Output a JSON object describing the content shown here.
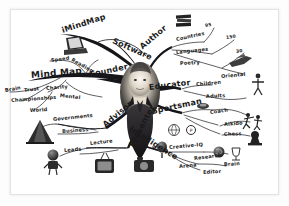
{
  "document": {
    "type": "mind-map",
    "title": "Tony Buzan Mind Map",
    "style": "hand-drawn grayscale organic mind map",
    "background_color": "#ffffff",
    "ink_color": "#1a1a1a",
    "paper_border_color": "#e3e3e3"
  },
  "center": {
    "label": "",
    "description": "photograph of a smiling man in a dark suit with white shirt and tie at the hub of the map",
    "name": "central-portrait"
  },
  "branches": [
    {
      "id": "imindmap",
      "label": "iMindMap",
      "angle": -18,
      "x": 62,
      "y": 32,
      "icon": "laptop-icon",
      "icon_x": 64,
      "icon_y": 38,
      "children": []
    },
    {
      "id": "software",
      "label": "Software",
      "angle": 22,
      "x": 113,
      "y": 39,
      "children": []
    },
    {
      "id": "mindmap",
      "label": "Mind Map",
      "angle": -6,
      "x": 34,
      "y": 76,
      "children": [
        {
          "label": "Speed",
          "x": 53,
          "y": 60,
          "angle": -8
        },
        {
          "label": "Reading",
          "x": 74,
          "y": 60,
          "angle": 28
        },
        {
          "label": "Brain",
          "x": 6,
          "y": 90,
          "angle": -10
        },
        {
          "label": "Trust",
          "x": 24,
          "y": 91,
          "angle": -6
        },
        {
          "label": "Charity",
          "x": 47,
          "y": 89,
          "angle": -4
        },
        {
          "label": "Championships",
          "x": 12,
          "y": 100,
          "angle": -3
        },
        {
          "label": "Mental",
          "x": 61,
          "y": 96,
          "angle": 4
        },
        {
          "label": "World",
          "x": 31,
          "y": 110,
          "angle": -2
        }
      ]
    },
    {
      "id": "founder",
      "label": "Founder",
      "angle": -14,
      "x": 93,
      "y": 75,
      "children": []
    },
    {
      "id": "author",
      "label": "Author",
      "angle": -22,
      "x": 140,
      "y": 47,
      "children": [
        {
          "label": "Countries",
          "x": 177,
          "y": 39,
          "angle": -12,
          "value": "95",
          "value_x": 206,
          "value_y": 26
        },
        {
          "label": "Languages",
          "x": 177,
          "y": 52,
          "angle": -6,
          "value": "150",
          "value_x": 227,
          "value_y": 38
        },
        {
          "label": "Poetry",
          "x": 180,
          "y": 63,
          "angle": -2,
          "value": "30",
          "value_x": 237,
          "value_y": 52
        },
        {
          "label": "Oriental",
          "x": 221,
          "y": 76,
          "angle": -4
        }
      ]
    },
    {
      "id": "educator",
      "label": "Educator",
      "angle": -6,
      "x": 148,
      "y": 86,
      "children": [
        {
          "label": "Children",
          "x": 196,
          "y": 84,
          "angle": -4
        },
        {
          "label": "Adults",
          "x": 205,
          "y": 96,
          "angle": -2
        }
      ]
    },
    {
      "id": "sportsman",
      "label": "Sportsman",
      "angle": -10,
      "x": 152,
      "y": 110,
      "children": [
        {
          "label": "Coach",
          "x": 210,
          "y": 112,
          "angle": -6
        },
        {
          "label": "Aikido",
          "x": 224,
          "y": 124,
          "angle": -4
        },
        {
          "label": "Chess",
          "x": 224,
          "y": 134,
          "angle": -2
        }
      ]
    },
    {
      "id": "intelligence",
      "label": "Intelligence",
      "angle": 28,
      "x": 133,
      "y": 128,
      "children": [
        {
          "label": "Creative-IQ",
          "x": 172,
          "y": 146,
          "angle": -4
        },
        {
          "label": "Research",
          "x": 196,
          "y": 158,
          "angle": -6
        },
        {
          "label": "Arena",
          "x": 180,
          "y": 166,
          "angle": -4
        },
        {
          "label": "Brain",
          "x": 224,
          "y": 164,
          "angle": -2
        },
        {
          "label": "Editor",
          "x": 203,
          "y": 172,
          "angle": -3
        }
      ]
    },
    {
      "id": "advisor",
      "label": "Advisor",
      "angle": -36,
      "x": 108,
      "y": 125,
      "children": [
        {
          "label": "Governments",
          "x": 54,
          "y": 119,
          "angle": -4
        },
        {
          "label": "Business",
          "x": 63,
          "y": 131,
          "angle": -3
        }
      ]
    },
    {
      "id": "presenter",
      "label": "Presenter",
      "angle": -60,
      "x": 132,
      "y": 145,
      "children": [
        {
          "label": "Lecture",
          "x": 91,
          "y": 143,
          "angle": -6
        },
        {
          "label": "Leads",
          "x": 65,
          "y": 150,
          "angle": -4
        }
      ]
    }
  ],
  "icons": [
    {
      "name": "laptop-icon",
      "x": 64,
      "y": 37,
      "w": 22,
      "h": 15,
      "glyph": "laptop"
    },
    {
      "name": "books-icon",
      "x": 176,
      "y": 14,
      "w": 16,
      "h": 14,
      "glyph": "books"
    },
    {
      "name": "aircraft-icon",
      "x": 229,
      "y": 56,
      "w": 22,
      "h": 13,
      "glyph": "plane"
    },
    {
      "name": "person-icon",
      "x": 253,
      "y": 74,
      "w": 10,
      "h": 20,
      "glyph": "person"
    },
    {
      "name": "whistle-icon",
      "x": 198,
      "y": 102,
      "w": 13,
      "h": 8,
      "glyph": "whistle"
    },
    {
      "name": "aikido-icon",
      "x": 244,
      "y": 112,
      "w": 18,
      "h": 16,
      "glyph": "martial-arts"
    },
    {
      "name": "chess-icon",
      "x": 246,
      "y": 130,
      "w": 16,
      "h": 14,
      "glyph": "chess-piece"
    },
    {
      "name": "medal-icon",
      "x": 186,
      "y": 124,
      "w": 11,
      "h": 11,
      "glyph": "medal"
    },
    {
      "name": "brain-icon",
      "x": 213,
      "y": 147,
      "w": 12,
      "h": 12,
      "glyph": "brain"
    },
    {
      "name": "trophy-icon",
      "x": 231,
      "y": 146,
      "w": 10,
      "h": 14,
      "glyph": "trophy"
    },
    {
      "name": "pyramid-icon",
      "x": 28,
      "y": 120,
      "w": 24,
      "h": 22,
      "glyph": "pyramid"
    },
    {
      "name": "robot-icon",
      "x": 44,
      "y": 150,
      "w": 18,
      "h": 20,
      "glyph": "robot"
    },
    {
      "name": "tv-icon",
      "x": 94,
      "y": 155,
      "w": 20,
      "h": 18,
      "glyph": "television"
    },
    {
      "name": "camera-icon",
      "x": 133,
      "y": 157,
      "w": 21,
      "h": 15,
      "glyph": "camera"
    },
    {
      "name": "mic-icon",
      "x": 156,
      "y": 143,
      "w": 14,
      "h": 14,
      "glyph": "microphone"
    },
    {
      "name": "globe-icon",
      "x": 168,
      "y": 124,
      "w": 14,
      "h": 14,
      "glyph": "globe"
    }
  ]
}
